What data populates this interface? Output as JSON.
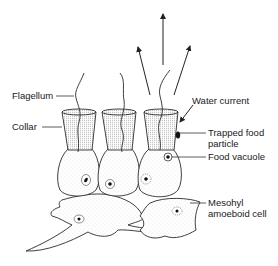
{
  "diagram": {
    "labels": {
      "flagellum": "Flagellum",
      "collar": "Collar",
      "water_current": "Water current",
      "trapped_food_line1": "Trapped food",
      "trapped_food_line2": "particle",
      "food_vacuole": "Food vacuole",
      "mesohyl_line1": "Mesohyl",
      "mesohyl_line2": "amoeboid cell"
    },
    "colors": {
      "ink": "#1a1a1a",
      "background": "#ffffff",
      "stipple": "#8a8a8a"
    }
  }
}
